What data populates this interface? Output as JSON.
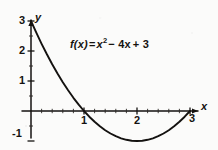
{
  "chart_data": {
    "type": "line",
    "title": "",
    "subtitle": "",
    "annotation": "f(x) = x² − 4x + 3",
    "equation": {
      "lhs": "f(x)",
      "equals": "=",
      "term1_base": "x",
      "term1_exp": "2",
      "term2": "− 4x",
      "term3": "+ 3"
    },
    "function": "x^2 - 4x + 3",
    "xlabel": "x",
    "ylabel": "y",
    "xlim": [
      -0.15,
      3.3
    ],
    "ylim": [
      -1.35,
      3.25
    ],
    "grid": false,
    "legend": null,
    "x_ticks": [
      1,
      2,
      3
    ],
    "x_tick_labels": [
      "1",
      "2",
      "3"
    ],
    "y_ticks": [
      -1,
      1,
      2,
      3
    ],
    "y_tick_labels": [
      "-1",
      "1",
      "2",
      "3"
    ],
    "minor_ticks": true,
    "roots": [
      1,
      3
    ],
    "vertex": [
      2,
      -1
    ],
    "y_intercept": 3,
    "series": [
      {
        "name": "f(x) = x^2 - 4x + 3",
        "color": "#141210",
        "x": [
          0.0,
          0.1,
          0.2,
          0.3,
          0.4,
          0.5,
          0.6,
          0.7,
          0.8,
          0.9,
          1.0,
          1.1,
          1.2,
          1.3,
          1.4,
          1.5,
          1.6,
          1.7,
          1.8,
          1.9,
          2.0,
          2.1,
          2.2,
          2.3,
          2.4,
          2.5,
          2.6,
          2.7,
          2.8,
          2.9,
          3.0
        ],
        "y": [
          3.0,
          2.61,
          2.24,
          1.89,
          1.56,
          1.25,
          0.96,
          0.69,
          0.44,
          0.21,
          0.0,
          -0.19,
          -0.36,
          -0.51,
          -0.64,
          -0.75,
          -0.84,
          -0.91,
          -0.96,
          -0.99,
          -1.0,
          -0.99,
          -0.96,
          -0.91,
          -0.84,
          -0.75,
          -0.64,
          -0.51,
          -0.36,
          -0.19,
          0.0
        ]
      }
    ]
  },
  "labels": {
    "y_axis": "y",
    "x_axis": "x",
    "y_tick_3": "3",
    "y_tick_2": "2",
    "y_tick_1": "1",
    "y_tick_neg1": "-1",
    "x_tick_1": "1",
    "x_tick_2": "2",
    "x_tick_3": "3"
  },
  "colors": {
    "background": "#fbfbfa",
    "ink": "#141210",
    "curve": "#141210"
  }
}
